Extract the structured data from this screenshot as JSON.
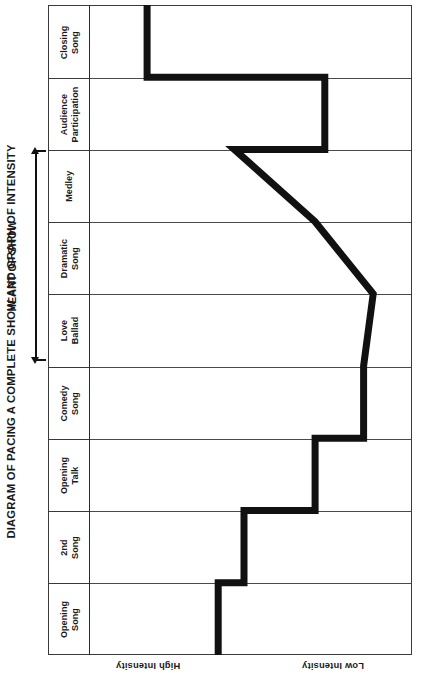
{
  "page": {
    "corner_mark": "",
    "background": "#ffffff",
    "ink": "#111111"
  },
  "title": "DIAGRAM OF PACING A COMPLETE SHOW AND GRAPH OF INTENSITY",
  "bracket": {
    "label": "HEART OF SHOW",
    "spans": [
      "Love Ballad",
      "Dramatic Song",
      "Medley"
    ]
  },
  "axis": {
    "high_label": "High Intensity",
    "low_label": "Low Intensity"
  },
  "chart_data": {
    "type": "line",
    "title": "DIAGRAM OF PACING A COMPLETE SHOW AND GRAPH OF INTENSITY",
    "orientation": "rotated-90ccw",
    "xlabel": "Intensity",
    "ylabel": "Show Segment",
    "grid": true,
    "legend": false,
    "axis_tick_labels": [
      "High Intensity",
      "Low Intensity"
    ],
    "categories": [
      "Closing Song",
      "Audience Participation",
      "Medley",
      "Dramatic Song",
      "Love Ballad",
      "Comedy Song",
      "Opening Talk",
      "2nd Song",
      "Opening Song"
    ],
    "intensity_scale": {
      "min": 0,
      "max": 100,
      "min_meaning": "Low Intensity",
      "max_meaning": "High Intensity"
    },
    "segment_intensity": [
      {
        "segment": "Opening Song",
        "intensity": 60
      },
      {
        "segment": "2nd Song",
        "intensity": 52
      },
      {
        "segment": "Opening Talk",
        "intensity": 30
      },
      {
        "segment": "Comedy Song",
        "intensity": 15
      },
      {
        "segment": "Love Ballad",
        "intensity": 12
      },
      {
        "segment": "Dramatic Song",
        "intensity": 30
      },
      {
        "segment": "Medley",
        "intensity": 55
      },
      {
        "segment": "Audience Participation",
        "intensity": 27
      },
      {
        "segment": "Closing Song",
        "intensity": 82
      }
    ],
    "annotations": [
      {
        "text": "HEART OF SHOW",
        "covers": [
          "Love Ballad",
          "Dramatic Song",
          "Medley"
        ]
      }
    ]
  },
  "polyline": {
    "stroke": "#111111",
    "stroke_width": 7,
    "points": "175,5 268,75 268,75 315,75 315,148 315,148 240,150 175,5"
  }
}
